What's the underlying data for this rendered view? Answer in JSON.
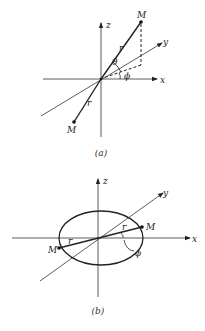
{
  "figure_a": {
    "caption": "(a)",
    "axis_labels": {
      "z": "z",
      "y": "y",
      "x": "x"
    },
    "mass_labels": {
      "upper": "M",
      "lower": "M"
    },
    "radius_labels": {
      "upper": "r",
      "lower": "r"
    },
    "angle_labels": {
      "theta": "θ",
      "phi": "ϕ"
    }
  },
  "figure_b": {
    "caption": "(b)",
    "axis_labels": {
      "z": "z",
      "y": "y",
      "x": "x"
    },
    "mass_labels": {
      "right": "M",
      "left": "M"
    },
    "radius_labels": {
      "right": "r",
      "left": "r"
    },
    "angle_labels": {
      "phi": "ϕ"
    }
  }
}
